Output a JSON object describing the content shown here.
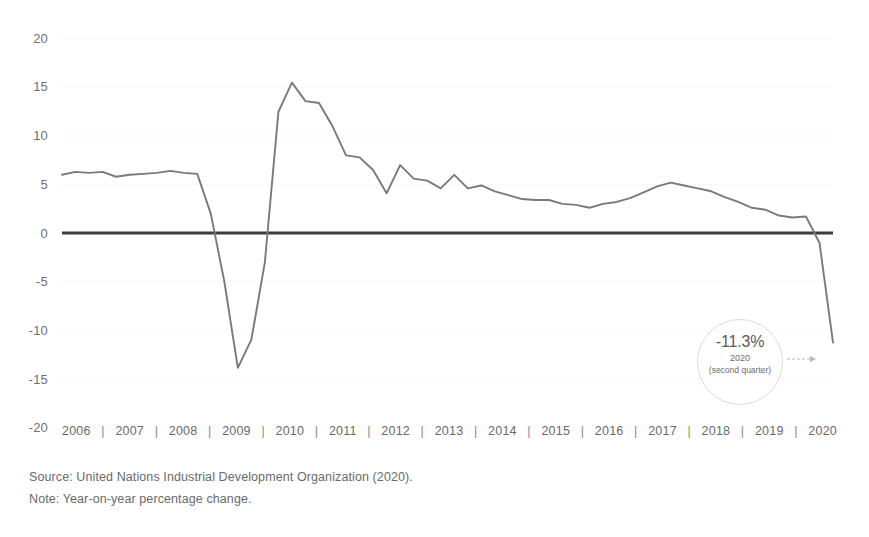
{
  "chart_data": {
    "type": "line",
    "title": "",
    "subtitle": "",
    "xlabel": "",
    "ylabel": "",
    "ylim": [
      -20,
      20
    ],
    "yticks": [
      20,
      15,
      10,
      5,
      0,
      -5,
      -10,
      -15,
      -20
    ],
    "ytick_labels": [
      "20",
      "15",
      "10",
      "5",
      "0",
      "-5",
      "-10",
      "-15",
      "-20"
    ],
    "grid": true,
    "grid_style": "dotted-horizontal",
    "legend": "none",
    "zero_line": true,
    "categories": [
      "2006",
      "2007",
      "2008",
      "2009",
      "2010",
      "2011",
      "2012",
      "2013",
      "2014",
      "2015",
      "2016",
      "2017",
      "2018",
      "2019",
      "2020"
    ],
    "x_separator": "|",
    "series": [
      {
        "name": "World manufacturing output growth",
        "color": "#7a7a7a",
        "x": [
          2006.0,
          2006.25,
          2006.5,
          2006.75,
          2007.0,
          2007.25,
          2007.5,
          2007.75,
          2008.0,
          2008.25,
          2008.5,
          2008.75,
          2009.0,
          2009.25,
          2009.5,
          2009.75,
          2010.0,
          2010.25,
          2010.5,
          2010.75,
          2011.0,
          2011.25,
          2011.5,
          2011.75,
          2012.0,
          2012.25,
          2012.5,
          2012.75,
          2013.0,
          2013.25,
          2013.5,
          2013.75,
          2014.0,
          2014.25,
          2014.5,
          2014.75,
          2015.0,
          2015.25,
          2015.5,
          2015.75,
          2016.0,
          2016.25,
          2016.5,
          2016.75,
          2017.0,
          2017.25,
          2017.5,
          2017.75,
          2018.0,
          2018.25,
          2018.5,
          2018.75,
          2019.0,
          2019.25,
          2019.5,
          2019.75,
          2020.0,
          2020.25
        ],
        "values": [
          6.0,
          6.3,
          6.2,
          6.3,
          5.8,
          6.0,
          6.1,
          6.2,
          6.4,
          6.2,
          6.1,
          2.0,
          -5.0,
          -13.9,
          -11.0,
          -3.0,
          12.5,
          15.5,
          13.6,
          13.4,
          11.0,
          8.0,
          7.8,
          6.5,
          4.1,
          7.0,
          5.6,
          5.4,
          4.6,
          6.0,
          4.6,
          4.9,
          4.3,
          3.9,
          3.5,
          3.4,
          3.4,
          3.0,
          2.9,
          2.6,
          3.0,
          3.2,
          3.6,
          4.2,
          4.8,
          5.2,
          4.9,
          4.6,
          4.3,
          3.7,
          3.2,
          2.6,
          2.4,
          1.8,
          1.6,
          1.7,
          -1.0,
          -11.3
        ]
      }
    ],
    "annotation": {
      "value": "-11.3%",
      "year": "2020",
      "period": "(second quarter)",
      "shape": "circle",
      "arrow": "right"
    }
  },
  "footnotes": {
    "source": "Source: United Nations Industrial Development Organization (2020).",
    "note": "Note: Year-on-year percentage change."
  }
}
